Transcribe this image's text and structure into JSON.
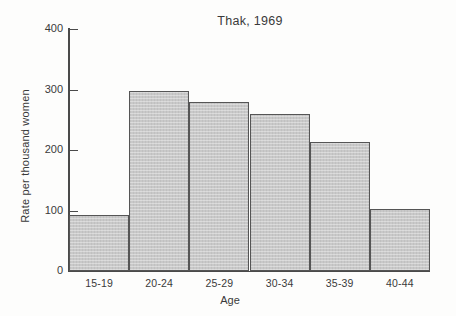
{
  "chart_data": {
    "type": "bar",
    "title": "Thak, 1969",
    "xlabel": "Age",
    "ylabel": "Rate per thousand women",
    "categories": [
      "15-19",
      "20-24",
      "25-29",
      "30-34",
      "35-39",
      "40-44"
    ],
    "values": [
      92,
      297,
      280,
      259,
      214,
      102
    ],
    "ylim": [
      0,
      400
    ],
    "yticks": [
      0,
      100,
      200,
      300,
      400
    ],
    "ytick_labels": [
      "0",
      "100",
      "200",
      "300",
      "400"
    ],
    "grid": false,
    "legend": false,
    "bar_fill_color": "#c9c9c9",
    "bar_edge_color": "#555555",
    "axis_color": "#4a4a4a",
    "background_color": "#fdfdfc"
  }
}
